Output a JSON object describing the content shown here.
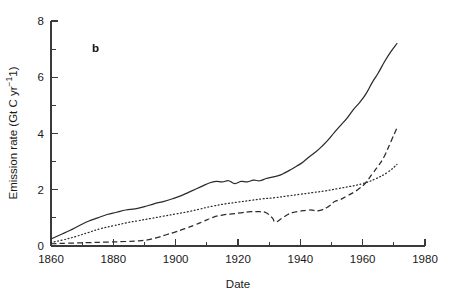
{
  "figure": {
    "panel_label": "b",
    "background": "#ffffff",
    "line_color": "#2b2b2b"
  },
  "chart_data": {
    "type": "line",
    "title": "",
    "xlabel": "Date",
    "ylabel": "Emission rate (Gt C yr−1)",
    "xlim": [
      1860,
      1980
    ],
    "ylim": [
      0,
      8
    ],
    "xticks": [
      1860,
      1880,
      1900,
      1920,
      1940,
      1960,
      1980
    ],
    "xticklabels": [
      "1860",
      "1880",
      "1900",
      "1920",
      "1940",
      "1960",
      "1980"
    ],
    "xminorticks": [
      1870,
      1890,
      1910,
      1930,
      1950,
      1970
    ],
    "yticks": [
      0,
      2,
      4,
      6,
      8
    ],
    "yticklabels": [
      "0",
      "2",
      "4",
      "6",
      "8"
    ],
    "yminorticks": [
      1,
      3,
      5,
      7
    ],
    "grid": false,
    "legend": "none",
    "series": [
      {
        "name": "solid",
        "style": "solid",
        "x": [
          1860,
          1863,
          1866,
          1869,
          1872,
          1875,
          1878,
          1881,
          1884,
          1887,
          1890,
          1893,
          1896,
          1899,
          1902,
          1905,
          1908,
          1911,
          1913,
          1915,
          1917,
          1919,
          1921,
          1923,
          1925,
          1927,
          1929,
          1931,
          1933,
          1935,
          1937,
          1939,
          1941,
          1943,
          1945,
          1947,
          1949,
          1951,
          1953,
          1955,
          1957,
          1959,
          1961,
          1963,
          1965,
          1967,
          1969,
          1971
        ],
        "y": [
          0.25,
          0.4,
          0.55,
          0.72,
          0.88,
          1.0,
          1.12,
          1.2,
          1.28,
          1.32,
          1.4,
          1.5,
          1.58,
          1.68,
          1.8,
          1.95,
          2.1,
          2.25,
          2.3,
          2.28,
          2.32,
          2.22,
          2.3,
          2.28,
          2.34,
          2.32,
          2.4,
          2.45,
          2.5,
          2.6,
          2.72,
          2.85,
          3.0,
          3.18,
          3.35,
          3.55,
          3.78,
          4.05,
          4.3,
          4.55,
          4.85,
          5.1,
          5.4,
          5.8,
          6.15,
          6.55,
          6.9,
          7.2
        ]
      },
      {
        "name": "dotted",
        "style": "dotted",
        "x": [
          1860,
          1864,
          1868,
          1872,
          1876,
          1880,
          1884,
          1888,
          1892,
          1896,
          1900,
          1904,
          1908,
          1912,
          1916,
          1920,
          1924,
          1928,
          1932,
          1936,
          1940,
          1944,
          1948,
          1952,
          1956,
          1960,
          1964,
          1968,
          1971
        ],
        "y": [
          0.12,
          0.22,
          0.34,
          0.48,
          0.62,
          0.72,
          0.82,
          0.9,
          0.98,
          1.06,
          1.14,
          1.22,
          1.32,
          1.42,
          1.5,
          1.56,
          1.62,
          1.68,
          1.72,
          1.78,
          1.84,
          1.9,
          1.96,
          2.04,
          2.12,
          2.22,
          2.38,
          2.62,
          2.9
        ]
      },
      {
        "name": "dashed",
        "style": "dashed",
        "x": [
          1860,
          1866,
          1872,
          1878,
          1884,
          1888,
          1891,
          1894,
          1897,
          1900,
          1903,
          1906,
          1909,
          1912,
          1915,
          1918,
          1921,
          1924,
          1927,
          1929,
          1931,
          1932,
          1934,
          1936,
          1938,
          1940,
          1943,
          1946,
          1949,
          1951,
          1953,
          1955,
          1957,
          1959,
          1961,
          1963,
          1965,
          1967,
          1969,
          1971
        ],
        "y": [
          0.08,
          0.1,
          0.12,
          0.14,
          0.16,
          0.18,
          0.22,
          0.3,
          0.4,
          0.5,
          0.62,
          0.74,
          0.88,
          1.02,
          1.1,
          1.14,
          1.18,
          1.22,
          1.22,
          1.18,
          1.0,
          0.85,
          0.98,
          1.12,
          1.2,
          1.24,
          1.28,
          1.26,
          1.4,
          1.58,
          1.66,
          1.78,
          1.9,
          2.05,
          2.25,
          2.55,
          2.85,
          3.2,
          3.7,
          4.2
        ]
      }
    ]
  }
}
